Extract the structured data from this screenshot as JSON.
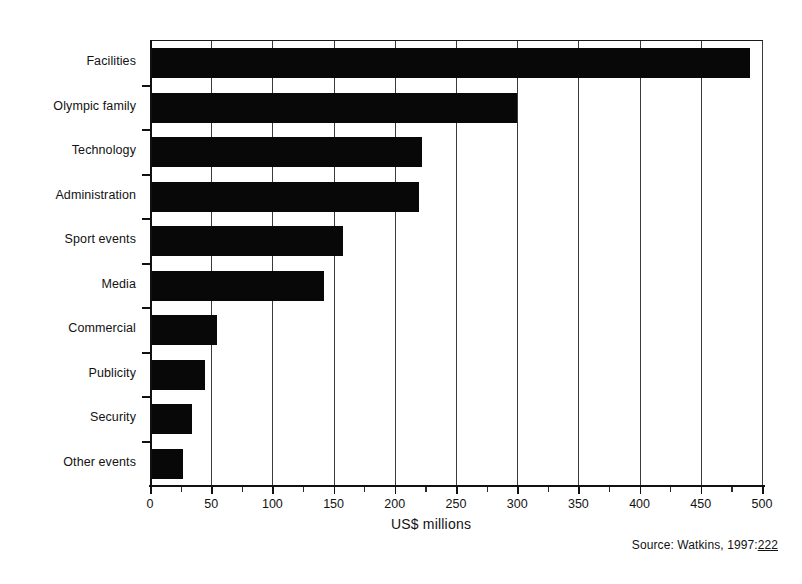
{
  "chart_data": {
    "type": "bar",
    "orientation": "horizontal",
    "title": "",
    "xlabel": "US$ millions",
    "ylabel": "",
    "xlim": [
      0,
      500
    ],
    "ylim": null,
    "grid": "vertical-major",
    "legend": null,
    "categories": [
      "Facilities",
      "Olympic family",
      "Technology",
      "Administration",
      "Sport events",
      "Media",
      "Commercial",
      "Publicity",
      "Security",
      "Other events"
    ],
    "values": [
      490,
      300,
      222,
      220,
      158,
      142,
      55,
      45,
      34,
      27
    ],
    "xticks": [
      0,
      50,
      100,
      150,
      200,
      250,
      300,
      350,
      400,
      450,
      500
    ],
    "xtick_labels": [
      "0",
      "50",
      "100",
      "150",
      "200",
      "250",
      "300",
      "350",
      "400",
      "450",
      "500"
    ],
    "minor_tick_step": 25,
    "bar_color": "#080808",
    "background_color": "#ffffff",
    "axis_color": "#111111",
    "annotations": [
      {
        "name": "source",
        "text": "Source: Watkins, 1997:222"
      }
    ]
  },
  "axis": {
    "x_title": "US$ millions"
  },
  "source": {
    "prefix": "Source: Watkins, 1997:",
    "page": "222",
    "full": "Source: Watkins, 1997:222"
  }
}
